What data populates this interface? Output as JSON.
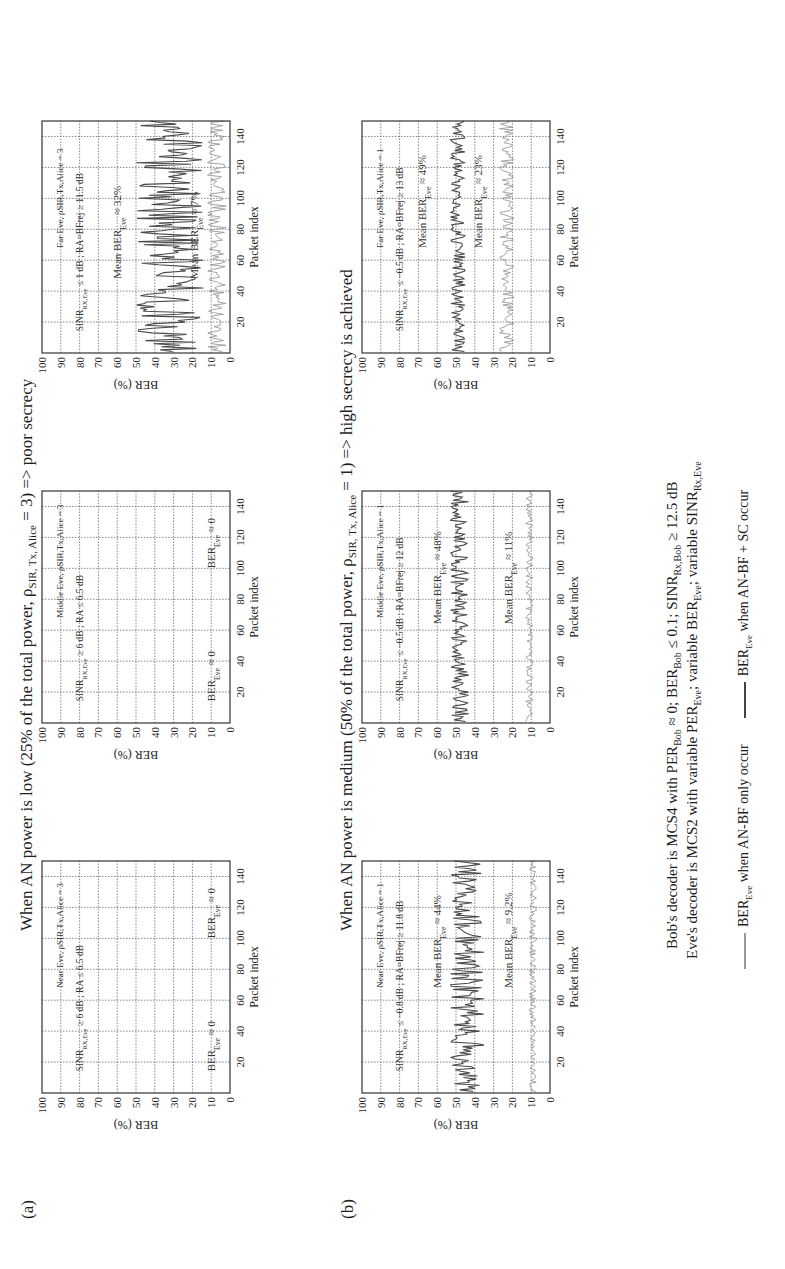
{
  "rows": [
    {
      "label": "(a)",
      "title_prefix": "When AN power is low (25% of the total power, ρ",
      "title_sub": "SIR, Tx, Alice",
      "title_suffix": " = 3) => poor secrecy",
      "charts": [
        {
          "name": "near-eve-low",
          "header": "Near Eve, ρSIR,Tx,Alice = 3",
          "condition": "SINR_RX,Eve ≥ 6 dB ; RA ≤ 6.5 dB",
          "ann_dark": "BER_Eve ≈ 0",
          "ann_dark_pos": [
            14,
            8
          ],
          "ann_light": "BER_Eve ≈ 0",
          "ann_light_pos": [
            100,
            8
          ],
          "ylabel": "BER (%)",
          "xlabel": "Packet index"
        },
        {
          "name": "middle-eve-low",
          "header": "Middle Eve, ρSIR,Tx,Alice = 3",
          "condition": "SINR_RX,Eve ≥ 6 dB ; RA ≤ 6.5 dB",
          "ann_dark": "BER_Eve ≈ 0",
          "ann_dark_pos": [
            14,
            8
          ],
          "ann_light": "BER_Eve ≈ 0",
          "ann_light_pos": [
            100,
            8
          ],
          "ylabel": "BER (%)",
          "xlabel": "Packet index"
        },
        {
          "name": "far-eve-low",
          "header": "Far Eve, ρSIR,Tx,Alice = 3",
          "condition": "SINR_RX,Eve ≤ 1 dB ; RA=BFrej ≥ 11.5 dB",
          "ann_dark": "Mean BER_Eve ≈ 32%",
          "ann_dark_pos": [
            48,
            58
          ],
          "ann_light": "Mean BER_Eve ≈ 7%",
          "ann_light_pos": [
            48,
            17
          ],
          "ylabel": "BER (%)",
          "xlabel": "Packet index"
        }
      ]
    },
    {
      "label": "(b)",
      "title_prefix": "When AN power is medium (50% of the total power, ρ",
      "title_sub": "SIR, Tx, Alice",
      "title_suffix": " = 1) => high secrecy is achieved",
      "charts": [
        {
          "name": "near-eve-medium",
          "header": "Near Eve, ρSIR,Tx,Alice = 1",
          "condition": "SINR_RX,Eve ≤ −0.8 dB ; RA=BFrej ≥ 11.8 dB",
          "ann_dark": "Mean BER_Eve ≈ 44%",
          "ann_dark_pos": [
            68,
            58
          ],
          "ann_light": "Mean BER_Eve ≈ 9.2%",
          "ann_light_pos": [
            68,
            20
          ],
          "ylabel": "BER (%)",
          "xlabel": "Packet index"
        },
        {
          "name": "middle-eve-medium",
          "header": "Middle Eve, ρSIR,Tx,Alice = 1",
          "condition": "SINR_RX,Eve ≤ −0.5 dB ; RA=BFrej ≥ 12 dB",
          "ann_dark": "Mean BER_Eve ≈ 48%",
          "ann_dark_pos": [
            64,
            58
          ],
          "ann_light": "Mean BER_Eve ≈ 11%",
          "ann_light_pos": [
            64,
            20
          ],
          "ylabel": "BER (%)",
          "xlabel": "Packet index"
        },
        {
          "name": "far-eve-medium",
          "header": "Far Eve, ρSIR,Tx,Alice = 1",
          "condition": "SINR_RX,Eve ≤ −0.5 dB ; RA=BFrej ≥ 13 dB",
          "ann_dark": "Mean BER_Eve ≈ 49%",
          "ann_dark_pos": [
            68,
            66
          ],
          "ann_light": "Mean BER_Eve ≈ 23%",
          "ann_light_pos": [
            68,
            36
          ],
          "ylabel": "BER (%)",
          "xlabel": "Packet index"
        }
      ]
    }
  ],
  "caption": {
    "line1": "Bob's decoder is MCS4 with PER_Bob ≈ 0; BER_Bob ≤ 0.1; SINR_Rx,Bob ≥ 12.5 dB",
    "line2": "Eve's decoder is MCS2 with variable PER_Eve; variable BER_Eve; variable SINR_Rx,Eve"
  },
  "legend": {
    "light": "BER_Eve when AN-BF only occur",
    "dark": "BER_Eve when AN-BF + SC occur",
    "light_color": "#9a9a9a",
    "dark_color": "#4a4a4a"
  },
  "chart_data": [
    {
      "type": "line",
      "title": "Near Eve, low AN power (ρSIR,Tx,Alice = 3)",
      "xlabel": "Packet index",
      "ylabel": "BER (%)",
      "xlim": [
        0,
        150
      ],
      "ylim": [
        0,
        100
      ],
      "xticks": [
        20,
        40,
        60,
        80,
        100,
        120,
        140
      ],
      "yticks": [
        0,
        10,
        20,
        30,
        40,
        50,
        60,
        70,
        80,
        90,
        100
      ],
      "grid": true,
      "series": [
        {
          "name": "BER_Eve when AN-BF only occur",
          "mean": 0,
          "spread": 0,
          "color": "#9a9a9a"
        },
        {
          "name": "BER_Eve when AN-BF + SC occur",
          "mean": 0,
          "spread": 0,
          "color": "#4a4a4a"
        }
      ]
    },
    {
      "type": "line",
      "title": "Middle Eve, low AN power (ρSIR,Tx,Alice = 3)",
      "xlabel": "Packet index",
      "ylabel": "BER (%)",
      "xlim": [
        0,
        150
      ],
      "ylim": [
        0,
        100
      ],
      "xticks": [
        20,
        40,
        60,
        80,
        100,
        120,
        140
      ],
      "yticks": [
        0,
        10,
        20,
        30,
        40,
        50,
        60,
        70,
        80,
        90,
        100
      ],
      "grid": true,
      "series": [
        {
          "name": "BER_Eve when AN-BF only occur",
          "mean": 0,
          "spread": 0,
          "color": "#9a9a9a"
        },
        {
          "name": "BER_Eve when AN-BF + SC occur",
          "mean": 0,
          "spread": 0,
          "color": "#4a4a4a"
        }
      ]
    },
    {
      "type": "line",
      "title": "Far Eve, low AN power (ρSIR,Tx,Alice = 3)",
      "xlabel": "Packet index",
      "ylabel": "BER (%)",
      "xlim": [
        0,
        150
      ],
      "ylim": [
        0,
        100
      ],
      "xticks": [
        20,
        40,
        60,
        80,
        100,
        120,
        140
      ],
      "yticks": [
        0,
        10,
        20,
        30,
        40,
        50,
        60,
        70,
        80,
        90,
        100
      ],
      "grid": true,
      "series": [
        {
          "name": "BER_Eve when AN-BF only occur",
          "mean": 7,
          "spread": 5,
          "color": "#9a9a9a"
        },
        {
          "name": "BER_Eve when AN-BF + SC occur",
          "mean": 32,
          "spread": 18,
          "color": "#4a4a4a"
        }
      ]
    },
    {
      "type": "line",
      "title": "Near Eve, medium AN power (ρSIR,Tx,Alice = 1)",
      "xlabel": "Packet index",
      "ylabel": "BER (%)",
      "xlim": [
        0,
        150
      ],
      "ylim": [
        0,
        100
      ],
      "xticks": [
        20,
        40,
        60,
        80,
        100,
        120,
        140
      ],
      "yticks": [
        0,
        10,
        20,
        30,
        40,
        50,
        60,
        70,
        80,
        90,
        100
      ],
      "grid": true,
      "series": [
        {
          "name": "BER_Eve when AN-BF only occur",
          "mean": 9.2,
          "spread": 2,
          "color": "#9a9a9a"
        },
        {
          "name": "BER_Eve when AN-BF + SC occur",
          "mean": 44,
          "spread": 9,
          "color": "#4a4a4a"
        }
      ]
    },
    {
      "type": "line",
      "title": "Middle Eve, medium AN power (ρSIR,Tx,Alice = 1)",
      "xlabel": "Packet index",
      "ylabel": "BER (%)",
      "xlim": [
        0,
        150
      ],
      "ylim": [
        0,
        100
      ],
      "xticks": [
        20,
        40,
        60,
        80,
        100,
        120,
        140
      ],
      "yticks": [
        0,
        10,
        20,
        30,
        40,
        50,
        60,
        70,
        80,
        90,
        100
      ],
      "grid": true,
      "series": [
        {
          "name": "BER_Eve when AN-BF only occur",
          "mean": 11,
          "spread": 2,
          "color": "#9a9a9a"
        },
        {
          "name": "BER_Eve when AN-BF + SC occur",
          "mean": 48,
          "spread": 5,
          "color": "#4a4a4a"
        }
      ]
    },
    {
      "type": "line",
      "title": "Far Eve, medium AN power (ρSIR,Tx,Alice = 1)",
      "xlabel": "Packet index",
      "ylabel": "BER (%)",
      "xlim": [
        0,
        150
      ],
      "ylim": [
        0,
        100
      ],
      "xticks": [
        20,
        40,
        60,
        80,
        100,
        120,
        140
      ],
      "yticks": [
        0,
        10,
        20,
        30,
        40,
        50,
        60,
        70,
        80,
        90,
        100
      ],
      "grid": true,
      "series": [
        {
          "name": "BER_Eve when AN-BF only occur",
          "mean": 23,
          "spread": 4,
          "color": "#9a9a9a"
        },
        {
          "name": "BER_Eve when AN-BF + SC occur",
          "mean": 49,
          "spread": 4,
          "color": "#4a4a4a"
        }
      ]
    }
  ]
}
